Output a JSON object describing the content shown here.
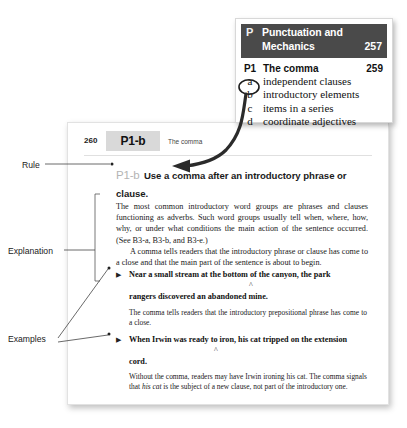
{
  "index_card": {
    "section_letter": "P",
    "section_title": "Punctuation and Mechanics",
    "section_page": "257",
    "entries": [
      {
        "mark": "P1",
        "label": "The comma",
        "page": "259"
      },
      {
        "mark": "a",
        "label": "independent clauses",
        "page": ""
      },
      {
        "mark": "b",
        "label": "introductory elements",
        "page": ""
      },
      {
        "mark": "c",
        "label": "items in a series",
        "page": ""
      },
      {
        "mark": "d",
        "label": "coordinate adjectives",
        "page": ""
      }
    ],
    "circled_entry": "b"
  },
  "book_page": {
    "folio": "260",
    "tag": "P1-b",
    "running_title": "The comma",
    "rule": {
      "number": "P1-b",
      "text": "Use a comma after an introductory phrase or clause."
    },
    "explanation": {
      "paragraph_1": "The most common introductory word groups are phrases and clauses functioning as adverbs. Such word groups usually tell when, where, how, why, or under what conditions the main action of the sentence occurred. (See B3-a, B3-b, and B3-e.)",
      "paragraph_2": "A comma tells readers that the introductory phrase or clause has come to a close and that the main part of the sentence is about to begin."
    },
    "examples": [
      {
        "bullet": "triangle-bullet",
        "sentence_line_1": "Near a small stream at the bottom of the canyon, the park",
        "sentence_line_2": "rangers discovered an abandoned mine.",
        "caret": "^",
        "note": "The comma tells readers that the introductory prepositional phrase has come to a close."
      },
      {
        "bullet": "triangle-bullet",
        "sentence_line_1": "When Irwin was ready to iron, his cat tripped on the extension",
        "sentence_line_2": "cord.",
        "caret": "^",
        "note_part_1": "Without the comma, readers may have Irwin ironing his cat. The comma signals that ",
        "note_italic": "his cat",
        "note_part_2": " is the subject of a new clause, not part of the introductory one."
      }
    ]
  },
  "annotations": {
    "rule_label": "Rule",
    "explanation_label": "Explanation",
    "examples_label": "Examples"
  },
  "colors": {
    "card_header_bg": "#4a4a4a",
    "tag_box_bg": "#d9d9d9",
    "rule_number_gray": "#b4b4b4",
    "arrow": "#2b2b2b"
  }
}
